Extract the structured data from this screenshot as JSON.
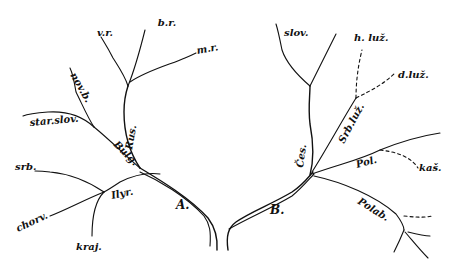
{
  "diagram": {
    "trunk": {
      "A": "A.",
      "B": "B."
    },
    "groups": {
      "rus": "Rus.",
      "bulg": "Bulg.",
      "ilyr": "Ilyr.",
      "ces": "Čes.",
      "srbluz": "Srb.luž.",
      "pol": "Pol.",
      "polab": "Polab."
    },
    "leaves": {
      "vr": "v.r.",
      "br": "b.r.",
      "mr": "m.r.",
      "novb": "nov.b.",
      "starslov": "star.slov.",
      "srb": "srb.",
      "chorv": "chorv.",
      "kraj": "kraj.",
      "slov": "slov.",
      "hluz": "h. luž.",
      "dluz": "d.luž.",
      "kas": "kaš."
    },
    "colors": {
      "ink": "#111111",
      "paper": "#ffffff"
    }
  }
}
